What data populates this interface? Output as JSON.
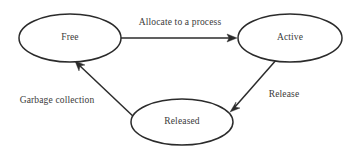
{
  "diagram": {
    "type": "state-transition-diagram",
    "background_color": "#ffffff",
    "stroke_color": "#2b2b2b",
    "text_color": "#3a3a3a",
    "nodes": [
      {
        "id": "free",
        "label": "Free",
        "shape": "ellipse",
        "cx": 70,
        "cy": 38,
        "rx": 51,
        "ry": 24
      },
      {
        "id": "active",
        "label": "Active",
        "shape": "ellipse",
        "cx": 290,
        "cy": 38,
        "rx": 52,
        "ry": 24
      },
      {
        "id": "released",
        "label": "Released",
        "shape": "ellipse",
        "cx": 182,
        "cy": 122,
        "rx": 51,
        "ry": 23
      }
    ],
    "edges": [
      {
        "id": "free-to-active",
        "from": "free",
        "to": "active",
        "label": "Allocate to a process",
        "label_x": 180,
        "label_y": 23,
        "x1": 121,
        "y1": 38,
        "x2": 237,
        "y2": 38
      },
      {
        "id": "active-to-released",
        "from": "active",
        "to": "released",
        "label": "Release",
        "label_x": 284,
        "label_y": 95,
        "x1": 277,
        "y1": 59,
        "x2": 230,
        "y2": 112
      },
      {
        "id": "released-to-free",
        "from": "released",
        "to": "free",
        "label": "Garbage collection",
        "label_x": 57,
        "label_y": 101,
        "x1": 136,
        "y1": 119,
        "x2": 75,
        "y2": 61
      }
    ]
  }
}
